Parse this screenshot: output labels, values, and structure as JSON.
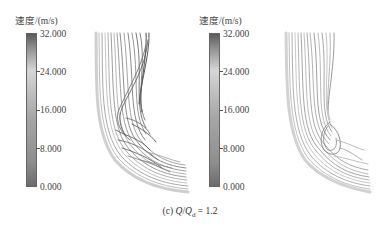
{
  "figure": {
    "caption": {
      "prefix": "(c) ",
      "q": "Q",
      "slash": "/",
      "qd": "Q",
      "sub": "d",
      "suffix": " = 1.2"
    },
    "panels": [
      {
        "colorbar": {
          "title": "速度/(m/s)",
          "ticks": [
            "32.000",
            "24.000",
            "16.000",
            "8.000",
            "0.000"
          ],
          "min": 0,
          "max": 32
        },
        "plot": "streamlines-left"
      },
      {
        "colorbar": {
          "title": "速度/(m/s)",
          "ticks": [
            "32.000",
            "24.000",
            "16.000",
            "8.000",
            "0.000"
          ],
          "min": 0,
          "max": 32
        },
        "plot": "streamlines-right"
      }
    ]
  }
}
